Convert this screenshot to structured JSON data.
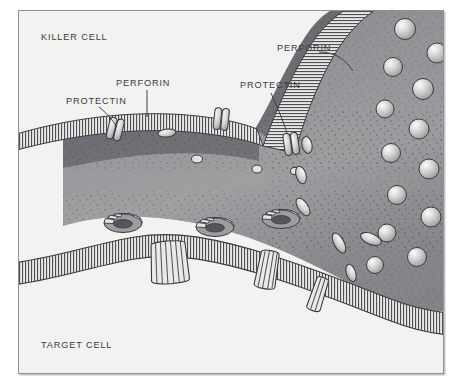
{
  "figure": {
    "background": "#ffffff",
    "plate_background": "#f2f2f0",
    "border_color": "#8f9094",
    "ink_color": "#3b3b42"
  },
  "labels": {
    "killer_cell": "KILLER CELL",
    "target_cell": "TARGET CELL",
    "protectin_left": "PROTECTIN",
    "perforin_left": "PERFORIN",
    "perforin_right": "PERFORIN",
    "protectin_right": "PROTECTIN"
  },
  "diagram": {
    "type": "biological-illustration",
    "cells": [
      {
        "name": "killer-cell",
        "label": "KILLER CELL",
        "region": "upper-right mass with striated membrane and stippled cytoplasm",
        "cytoplasm_color": "#9a9a9c",
        "membrane_style": "hatched bilayer"
      },
      {
        "name": "target-cell",
        "label": "TARGET CELL",
        "region": "lower band below the horizontal hatched membrane",
        "cytoplasm_color": "#f2f2f0",
        "membrane_style": "hatched bilayer"
      }
    ],
    "structures": [
      {
        "name": "protectin",
        "description": "protective protein embedded in the killer cell membrane",
        "count_visible": 3,
        "shape": "paired rounded capsule spanning the membrane"
      },
      {
        "name": "perforin-monomer",
        "description": "elongated perforin granule released into the intercellular space",
        "count_visible": 7,
        "shape": "elongated oval"
      },
      {
        "name": "perforin-pore",
        "description": "assembled perforin ring forming a pore in the target cell membrane",
        "count_visible": 4,
        "shape": "barrel ring seen from above and in cross-section"
      },
      {
        "name": "secretory-vesicle",
        "description": "spherical granules inside the killer cell cytoplasm at the right",
        "count_visible": 13,
        "shape": "sphere with specular highlight"
      }
    ],
    "leader_lines": [
      {
        "label": "PROTECTIN",
        "side": "left",
        "target": "membrane protein at upper-left of killer cell"
      },
      {
        "label": "PERFORIN",
        "side": "left",
        "target": "perforin near upper-left membrane"
      },
      {
        "label": "PERFORIN",
        "side": "right",
        "target": "hatched membrane at the fold"
      },
      {
        "label": "PROTECTIN",
        "side": "right",
        "target": "protein at the inner membrane bend"
      }
    ]
  }
}
